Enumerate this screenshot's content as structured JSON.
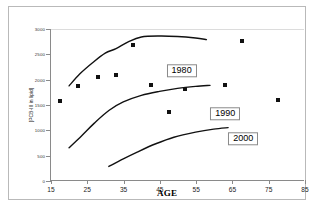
{
  "chart_data": {
    "type": "line",
    "title": "",
    "xlabel": "AGE",
    "ylabel": "[PCB-III in lipid]",
    "xlim": [
      15,
      85
    ],
    "ylim": [
      0,
      3000
    ],
    "xticks": [
      15,
      25,
      35,
      45,
      55,
      65,
      75,
      85
    ],
    "yticks": [
      0,
      500,
      1000,
      1500,
      2000,
      2500,
      3000
    ],
    "grid": false,
    "legend_position": "inline-boxed-labels",
    "series": [
      {
        "name": "1980",
        "label": "1980",
        "label_x": 51,
        "label_y": 2180,
        "curve": [
          {
            "x": 20.0,
            "y": 1870
          },
          {
            "x": 23.0,
            "y": 2110
          },
          {
            "x": 26.5,
            "y": 2330
          },
          {
            "x": 30.0,
            "y": 2520
          },
          {
            "x": 33.0,
            "y": 2610
          },
          {
            "x": 36.5,
            "y": 2750
          },
          {
            "x": 40.0,
            "y": 2840
          },
          {
            "x": 45.0,
            "y": 2860
          },
          {
            "x": 50.0,
            "y": 2850
          },
          {
            "x": 55.0,
            "y": 2820
          },
          {
            "x": 58.0,
            "y": 2790
          }
        ]
      },
      {
        "name": "1990",
        "label": "1990",
        "label_x": 63,
        "label_y": 1330,
        "curve": [
          {
            "x": 20.0,
            "y": 640
          },
          {
            "x": 23.5,
            "y": 880
          },
          {
            "x": 27.0,
            "y": 1130
          },
          {
            "x": 31.0,
            "y": 1380
          },
          {
            "x": 35.0,
            "y": 1550
          },
          {
            "x": 40.0,
            "y": 1680
          },
          {
            "x": 45.0,
            "y": 1760
          },
          {
            "x": 50.0,
            "y": 1820
          },
          {
            "x": 55.0,
            "y": 1860
          },
          {
            "x": 59.0,
            "y": 1880
          }
        ]
      },
      {
        "name": "2000",
        "label": "2000",
        "label_x": 68,
        "label_y": 830,
        "curve": [
          {
            "x": 31.0,
            "y": 270
          },
          {
            "x": 35.0,
            "y": 420
          },
          {
            "x": 39.0,
            "y": 560
          },
          {
            "x": 44.0,
            "y": 720
          },
          {
            "x": 49.0,
            "y": 850
          },
          {
            "x": 55.0,
            "y": 950
          },
          {
            "x": 60.0,
            "y": 1010
          },
          {
            "x": 64.0,
            "y": 1040
          }
        ]
      }
    ],
    "scatter_points": [
      {
        "x": 17.5,
        "y": 1570
      },
      {
        "x": 22.5,
        "y": 1870
      },
      {
        "x": 28.0,
        "y": 2060
      },
      {
        "x": 33.0,
        "y": 2100
      },
      {
        "x": 37.5,
        "y": 2690
      },
      {
        "x": 42.5,
        "y": 1900
      },
      {
        "x": 47.5,
        "y": 1370
      },
      {
        "x": 52.0,
        "y": 1810
      },
      {
        "x": 63.0,
        "y": 1900
      },
      {
        "x": 67.5,
        "y": 2770
      },
      {
        "x": 77.5,
        "y": 1600
      }
    ]
  }
}
